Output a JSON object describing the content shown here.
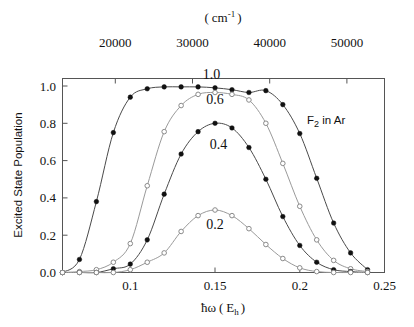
{
  "figure": {
    "annotation": "F2 in Ar",
    "annotation_base": "F",
    "annotation_sub": "2",
    "annotation_tail": " in  Ar"
  },
  "chart_data": {
    "type": "line",
    "title": "",
    "xlabel": "ħω ( E_h )",
    "xlabel_parts": {
      "hbar_omega": "ħω",
      "open": "(",
      "base": "E",
      "sub": "h",
      "close": ")"
    },
    "ylabel": "Excited State Population",
    "top_axis_label": "( cm-1 )",
    "top_axis_parts": {
      "open": "(",
      "unit": "cm",
      "exponent": "-1",
      "close": ")"
    },
    "xlim": [
      0.06,
      0.25
    ],
    "ylim": [
      0.0,
      1.04
    ],
    "xticks": [
      0.1,
      0.15,
      0.2,
      0.25
    ],
    "xtick_labels": [
      "0.1",
      "0.15",
      "0.2",
      "0.25"
    ],
    "yticks": [
      0.0,
      0.2,
      0.4,
      0.6,
      0.8,
      1.0
    ],
    "ytick_labels": [
      "0.0",
      "0.2",
      "0.4",
      "0.6",
      "0.8",
      "1.0"
    ],
    "top_xticks": [
      20000,
      30000,
      40000,
      50000
    ],
    "top_xtick_labels": [
      "20000",
      "30000",
      "40000",
      "50000"
    ],
    "top_axis_scale_hartree_per_cm": 219474.63,
    "grid": false,
    "legend": "inline-curve-labels",
    "x": [
      0.06,
      0.07,
      0.08,
      0.09,
      0.1,
      0.11,
      0.12,
      0.13,
      0.14,
      0.15,
      0.16,
      0.17,
      0.18,
      0.19,
      0.2,
      0.21,
      0.22,
      0.23,
      0.24
    ],
    "series": [
      {
        "name": "1.0",
        "label": "1.0",
        "marker": "filled-circle",
        "values": [
          0.0,
          0.07,
          0.38,
          0.75,
          0.94,
          0.985,
          0.995,
          0.995,
          0.995,
          0.99,
          0.98,
          0.965,
          0.975,
          0.9,
          0.745,
          0.505,
          0.265,
          0.105,
          0.015
        ],
        "label_x": 0.148,
        "label_y": 1.035
      },
      {
        "name": "0.6",
        "label": "0.6",
        "marker": "open-circle",
        "values": [
          0.0,
          0.005,
          0.015,
          0.055,
          0.155,
          0.465,
          0.755,
          0.895,
          0.955,
          0.965,
          0.955,
          0.925,
          0.8,
          0.585,
          0.355,
          0.175,
          0.065,
          0.02,
          0.005
        ],
        "label_x": 0.15,
        "label_y": 0.905
      },
      {
        "name": "0.4",
        "label": "0.4",
        "marker": "filled-circle",
        "values": [
          0.0,
          0.0,
          0.0,
          0.02,
          0.045,
          0.175,
          0.42,
          0.635,
          0.755,
          0.8,
          0.775,
          0.67,
          0.5,
          0.3,
          0.145,
          0.055,
          0.015,
          0.005,
          0.0
        ],
        "label_x": 0.152,
        "label_y": 0.665
      },
      {
        "name": "0.2",
        "label": "0.2",
        "marker": "open-circle",
        "values": [
          0.0,
          0.0,
          0.0,
          0.0,
          0.015,
          0.055,
          0.105,
          0.22,
          0.305,
          0.335,
          0.305,
          0.235,
          0.15,
          0.075,
          0.025,
          0.005,
          0.0,
          0.0,
          0.0
        ],
        "label_x": 0.15,
        "label_y": 0.235
      }
    ]
  }
}
